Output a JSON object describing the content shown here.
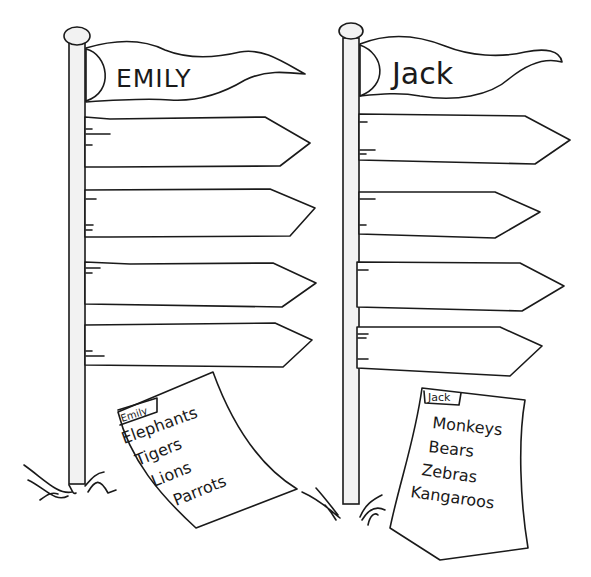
{
  "worksheet": {
    "signposts": [
      {
        "name": "EMILY",
        "arrows": [
          "",
          "",
          "",
          ""
        ],
        "list": {
          "tab_label": "Emily",
          "items": [
            "Elephants",
            "Tigers",
            "Lions",
            "Parrots"
          ]
        }
      },
      {
        "name": "Jack",
        "arrows": [
          "",
          "",
          "",
          ""
        ],
        "list": {
          "tab_label": "Jack",
          "items": [
            "Monkeys",
            "Bears",
            "Zebras",
            "Kangaroos"
          ]
        }
      }
    ]
  },
  "colors": {
    "ink": "#1a1a1a",
    "pole_fill": "#f2f2f2",
    "paper": "#ffffff"
  }
}
